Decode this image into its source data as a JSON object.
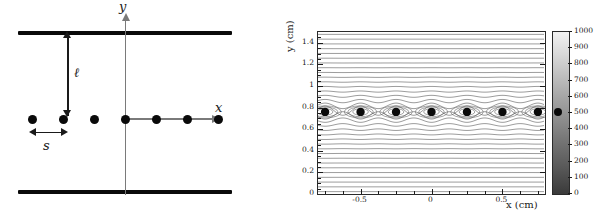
{
  "figure": {
    "caption_absent": true,
    "panels": [
      "schematic",
      "contour-plot"
    ]
  },
  "left_panel": {
    "title": "",
    "axis_labels": {
      "x": "x",
      "y": "y"
    },
    "measure_labels": {
      "plate_gap": "ℓ",
      "charge_spacing": "s"
    },
    "plate_count": 2,
    "charge_count": 7,
    "charge_positions_x": [
      32,
      63,
      94,
      125,
      156,
      187,
      218
    ],
    "description_elements": [
      "top-plate",
      "bottom-plate",
      "x-axis",
      "y-axis",
      "charge-dots",
      "ell-measure",
      "s-measure"
    ]
  },
  "chart_data": {
    "type": "heatmap",
    "title": "",
    "xlabel": "x (cm)",
    "ylabel": "y (cm)",
    "xlim": [
      -0.8,
      0.8
    ],
    "ylim": [
      0,
      1.5
    ],
    "xticks": [
      -0.5,
      0,
      0.5
    ],
    "xtick_labels": [
      "-0.5",
      "0",
      "0.5"
    ],
    "yticks": [
      0,
      0.2,
      0.4,
      0.6,
      0.8,
      1,
      1.2,
      1.4
    ],
    "ytick_labels": [
      "0",
      "0.2",
      "0.4",
      "0.6",
      "0.8",
      "1",
      "1.2",
      "1.4"
    ],
    "colorbar": {
      "min": 0,
      "max": 1000,
      "ticks": [
        0,
        100,
        200,
        300,
        400,
        500,
        600,
        700,
        800,
        900,
        1000
      ],
      "tick_labels": [
        "0",
        "100",
        "200",
        "300",
        "400",
        "500",
        "600",
        "700",
        "800",
        "900",
        "1000"
      ],
      "scale": "grayscale",
      "low_color": "#3a3a3a",
      "high_color": "#f2f2f2",
      "marker_value": 500
    },
    "grid": false,
    "legend": "none",
    "markers": {
      "name": "charge-dots",
      "count": 7,
      "y_value": 0.76,
      "x_values": [
        -0.75,
        -0.5,
        -0.25,
        0,
        0.25,
        0.5,
        0.75
      ],
      "color": "#0a0a0a"
    },
    "contours": {
      "style": "equipotential-lines",
      "color": "#555555",
      "horizontal_line_count": 34,
      "closed_loops_per_marker": 3,
      "note": "near-horizontal equipotential lines with closed loops encircling each charge at y = 0.76 cm"
    }
  }
}
